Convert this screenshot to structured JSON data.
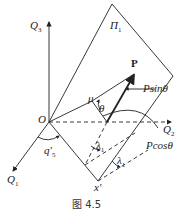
{
  "figure": {
    "caption": "图 4.5",
    "labels": {
      "q3": "Q",
      "q3_sub": "3",
      "q2": "Q",
      "q2_sub": "2",
      "q1": "Q",
      "q1_sub": "1",
      "pi": "Π",
      "pi_sub": "1",
      "p": "P",
      "psin": "Psinθ",
      "pcos": "Pcosθ",
      "o": "O",
      "mu": "μ",
      "theta": "θ",
      "q5": "q′",
      "q5_sub": "5",
      "lambda1a": "λ",
      "lambda1a_sub": "1",
      "lambda1b": "λ",
      "lambda1b_sub": "1",
      "x": "x′"
    },
    "colors": {
      "stroke": "#222222",
      "background": "#ffffff"
    }
  }
}
